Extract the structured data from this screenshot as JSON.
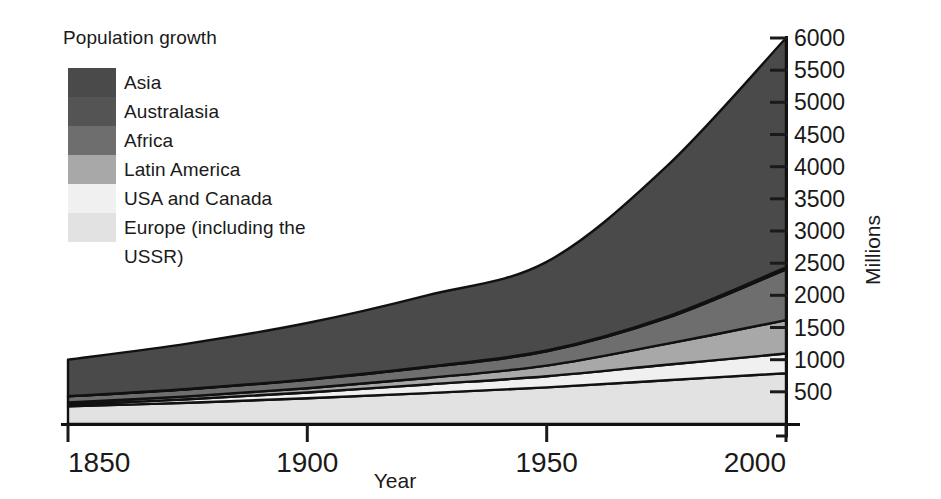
{
  "legend": {
    "title": "Population growth",
    "items": [
      {
        "label": "Asia",
        "color": "#4a4a4a"
      },
      {
        "label": "Australasia",
        "color": "#545454"
      },
      {
        "label": "Africa",
        "color": "#6e6e6e"
      },
      {
        "label": "Latin America",
        "color": "#a8a8a8"
      },
      {
        "label": "USA and Canada",
        "color": "#f0f0f0"
      },
      {
        "label": "Europe (including the",
        "color": "#e2e2e2"
      },
      {
        "label": "USSR)",
        "color": null
      }
    ]
  },
  "axes": {
    "y_title": "Millions",
    "x_title": "Year",
    "y_ticks": [
      "6000",
      "5500",
      "5000",
      "4500",
      "4000",
      "3500",
      "3000",
      "2500",
      "2000",
      "1500",
      "1000",
      "500"
    ],
    "x_ticks": [
      "1850",
      "1900",
      "1950",
      "2000"
    ]
  },
  "chart_data": {
    "type": "area",
    "title": "Population growth",
    "xlabel": "Year",
    "ylabel": "Millions",
    "xlim": [
      1850,
      2000
    ],
    "ylim": [
      0,
      6000
    ],
    "grid": false,
    "legend_position": "top-left",
    "stacked": true,
    "stack_order_bottom_to_top": [
      "Europe (including the USSR)",
      "USA and Canada",
      "Latin America",
      "Africa",
      "Australasia",
      "Asia"
    ],
    "x": [
      1850,
      1875,
      1900,
      1925,
      1950,
      1975,
      2000
    ],
    "series": [
      {
        "name": "Europe (including the USSR)",
        "color": "#e2e2e2",
        "values": [
          275,
          330,
          400,
          480,
          570,
          680,
          790
        ]
      },
      {
        "name": "USA and Canada",
        "color": "#f0f0f0",
        "values": [
          26,
          55,
          90,
          135,
          172,
          240,
          305
        ]
      },
      {
        "name": "Latin America",
        "color": "#a8a8a8",
        "values": [
          33,
          45,
          65,
          100,
          165,
          325,
          520
        ]
      },
      {
        "name": "Africa",
        "color": "#6e6e6e",
        "values": [
          95,
          110,
          133,
          165,
          222,
          400,
          790
        ]
      },
      {
        "name": "Australasia",
        "color": "#545454",
        "values": [
          2,
          4,
          6,
          9,
          13,
          21,
          30
        ]
      },
      {
        "name": "Asia",
        "color": "#4a4a4a",
        "values": [
          569,
          706,
          876,
          1111,
          1378,
          2334,
          3565
        ]
      }
    ],
    "totals": [
      1000,
      1250,
      1570,
      2000,
      2520,
      4000,
      6000
    ]
  },
  "colors": {
    "axis": "#1a1a1a",
    "text": "#1a1a1a",
    "background": "#ffffff",
    "outline": "#111111"
  }
}
